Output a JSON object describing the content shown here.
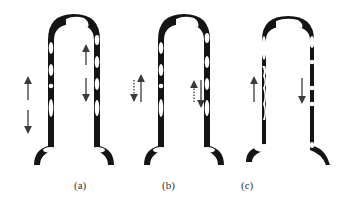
{
  "figure": {
    "panels": [
      {
        "id": "a",
        "label": "(a)",
        "left_leg_bubbles": 5,
        "right_leg_bubbles": 5,
        "arrows": [
          {
            "leg": "left",
            "direction": "up",
            "style": "solid"
          },
          {
            "leg": "left",
            "direction": "down",
            "style": "solid"
          },
          {
            "leg": "right",
            "direction": "up",
            "style": "solid"
          },
          {
            "leg": "right",
            "direction": "down",
            "style": "solid"
          }
        ]
      },
      {
        "id": "b",
        "label": "(b)",
        "left_leg_bubbles": 5,
        "right_leg_bubbles": 5,
        "arrows": [
          {
            "leg": "left",
            "direction": "up",
            "style": "solid"
          },
          {
            "leg": "left",
            "direction": "down",
            "style": "dotted"
          },
          {
            "leg": "right",
            "direction": "down",
            "style": "solid"
          },
          {
            "leg": "right",
            "direction": "up",
            "style": "dotted"
          }
        ]
      },
      {
        "id": "c",
        "label": "(c)",
        "left_leg_bubbles": 2,
        "right_leg_bubbles": 5,
        "arrows": [
          {
            "leg": "left",
            "direction": "up",
            "style": "solid"
          },
          {
            "leg": "right",
            "direction": "down",
            "style": "solid"
          }
        ]
      }
    ],
    "colors": {
      "tube": "#141414",
      "bubble": "#ffffff",
      "arrow": "#3a3a3a"
    }
  }
}
